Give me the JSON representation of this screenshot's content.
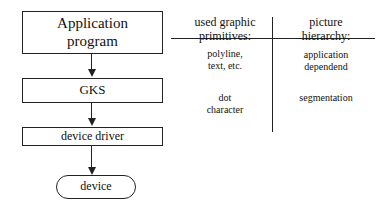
{
  "flowchart": {
    "nodes": [
      {
        "id": "app",
        "label_line1": "Application",
        "label_line2": "program"
      },
      {
        "id": "gks",
        "label": "GKS"
      },
      {
        "id": "driver",
        "label": "device driver"
      },
      {
        "id": "device",
        "label": "device"
      }
    ]
  },
  "table": {
    "headers": {
      "col1_line1": "used graphic",
      "col1_line2": "primitives:",
      "col2_line1": "picture",
      "col2_line2": "hierarchy:"
    },
    "rows": [
      {
        "col1_line1": "polyline,",
        "col1_line2": "text, etc.",
        "col2_line1": "application",
        "col2_line2": "dependend"
      },
      {
        "col1_line1": "dot",
        "col1_line2": "character",
        "col2_line1": "segmentation",
        "col2_line2": ""
      }
    ]
  }
}
